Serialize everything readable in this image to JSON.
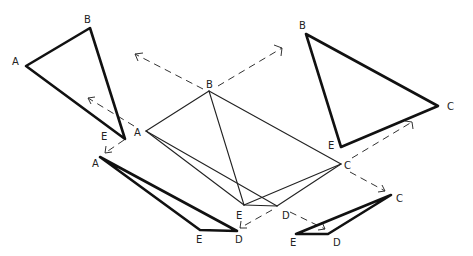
{
  "diagram": {
    "center_figure": {
      "name": "pyramid",
      "vertices": [
        "A",
        "B",
        "C",
        "D",
        "E"
      ],
      "labels": {
        "A": "A",
        "B": "B",
        "C": "C",
        "D": "D",
        "E": "E"
      }
    },
    "faces": [
      {
        "id": "face-ABE",
        "position": "top-left",
        "labels": [
          "A",
          "B",
          "E"
        ]
      },
      {
        "id": "face-BCE",
        "position": "top-right",
        "labels": [
          "B",
          "C",
          "E"
        ]
      },
      {
        "id": "face-AED",
        "position": "bottom-left",
        "labels": [
          "A",
          "E",
          "D"
        ]
      },
      {
        "id": "face-CED",
        "position": "bottom-right",
        "labels": [
          "C",
          "E",
          "D"
        ]
      }
    ],
    "arrows": [
      {
        "from": "B",
        "direction": "upper-left"
      },
      {
        "from": "B",
        "direction": "upper-right"
      },
      {
        "from": "A",
        "direction": "upper-left"
      },
      {
        "from": "A",
        "direction": "lower-left"
      },
      {
        "from": "C",
        "direction": "upper-right"
      },
      {
        "from": "C",
        "direction": "lower-right"
      },
      {
        "from": "D",
        "direction": "lower-right"
      },
      {
        "from": "D",
        "direction": "lower-left"
      }
    ]
  }
}
